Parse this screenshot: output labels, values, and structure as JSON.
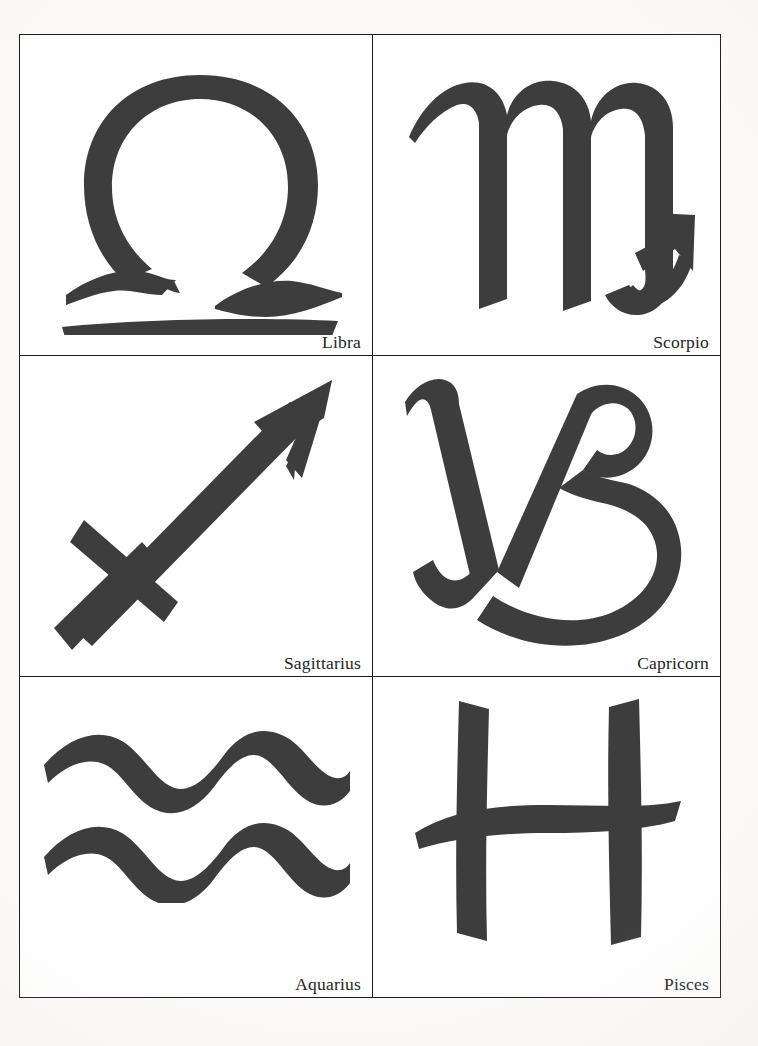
{
  "page": {
    "background_color": "#fbfaf7",
    "plate_background_color": "#ffffff",
    "rule_color": "#1b1b1b",
    "ink_color": "#3d3d3d",
    "label_color": "#252525"
  },
  "plate": {
    "columns": 2,
    "rows": 3,
    "cells": [
      {
        "id": "libra",
        "label": "Libra",
        "symbol": "libra-symbol",
        "unicode": "♎",
        "row": 1,
        "column": 1
      },
      {
        "id": "scorpio",
        "label": "Scorpio",
        "symbol": "scorpio-symbol",
        "unicode": "♏",
        "row": 1,
        "column": 2
      },
      {
        "id": "sagittarius",
        "label": "Sagittarius",
        "symbol": "sagittarius-symbol",
        "unicode": "♐",
        "row": 2,
        "column": 1
      },
      {
        "id": "capricorn",
        "label": "Capricorn",
        "symbol": "capricorn-symbol",
        "unicode": "♑",
        "row": 2,
        "column": 2
      },
      {
        "id": "aquarius",
        "label": "Aquarius",
        "symbol": "aquarius-symbol",
        "unicode": "♒",
        "row": 3,
        "column": 1
      },
      {
        "id": "pisces",
        "label": "Pisces",
        "symbol": "pisces-symbol",
        "unicode": "♓",
        "row": 3,
        "column": 2
      }
    ]
  }
}
